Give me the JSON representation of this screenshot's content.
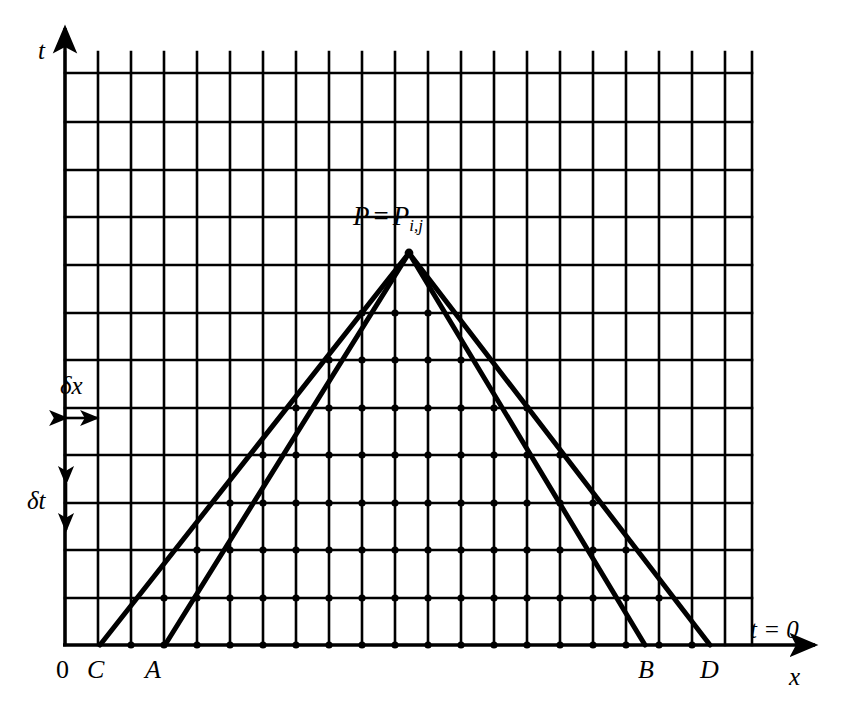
{
  "figure": {
    "kind": "cfl-domain-of-dependence-grid",
    "background_color": "#ffffff",
    "ink_color": "#000000",
    "width": 847,
    "height": 718
  },
  "axes": {
    "t_label": "t",
    "x_label": "x",
    "origin_label": "0",
    "initial_line_label": "t = 0",
    "x_axis_y": 645,
    "t_axis_x": 65,
    "x_axis_arrow_tip_x": 815,
    "t_axis_arrow_tip_y": 28
  },
  "spacing": {
    "dx_label": "δx",
    "dt_label": "δt",
    "dx_pixels": 33,
    "dt_pixels": 48
  },
  "apex": {
    "label_main": "P",
    "label_equals": "=",
    "label_point": "P",
    "label_subscript": "i,j",
    "x": 409,
    "y": 253
  },
  "foot_points": [
    {
      "name": "C",
      "label": "C",
      "x": 100,
      "y": 645
    },
    {
      "name": "A",
      "label": "A",
      "x": 165,
      "y": 645
    },
    {
      "name": "B",
      "label": "B",
      "x": 645,
      "y": 645
    },
    {
      "name": "D",
      "label": "D",
      "x": 710,
      "y": 645
    }
  ],
  "chart_data": {
    "type": "line",
    "title": "",
    "xlabel": "x",
    "ylabel": "t",
    "grid": true,
    "legend": false,
    "x_gridlines": [
      65,
      98,
      131,
      164,
      197,
      230,
      263,
      296,
      329,
      362,
      395,
      428,
      461,
      494,
      527,
      560,
      593,
      626,
      659,
      692,
      725,
      752
    ],
    "y_gridlines": [
      73,
      122,
      170,
      217,
      265,
      313,
      360,
      408,
      455,
      503,
      550,
      598,
      645
    ],
    "gridline_top_overshoot_y": 52,
    "series": [
      {
        "name": "characteristic-AP",
        "points": [
          [
            165,
            645
          ],
          [
            409,
            253
          ]
        ]
      },
      {
        "name": "characteristic-PB",
        "points": [
          [
            409,
            253
          ],
          [
            645,
            645
          ]
        ]
      },
      {
        "name": "numerical-edge-CP",
        "points": [
          [
            100,
            645
          ],
          [
            409,
            253
          ]
        ]
      },
      {
        "name": "numerical-edge-PD",
        "points": [
          [
            409,
            253
          ],
          [
            710,
            645
          ]
        ]
      }
    ],
    "annotations": [
      {
        "text": "P = P",
        "sub": "i,j",
        "x": 409,
        "y": 253
      },
      {
        "text": "t = 0",
        "x": 750,
        "y": 628
      },
      {
        "text": "δx",
        "x": 72,
        "y": 385
      },
      {
        "text": "δt",
        "x": 40,
        "y": 500
      }
    ],
    "mesh_points_note": "dots drawn at grid intersections inside the numerical domain of dependence triangle C-P-D"
  }
}
